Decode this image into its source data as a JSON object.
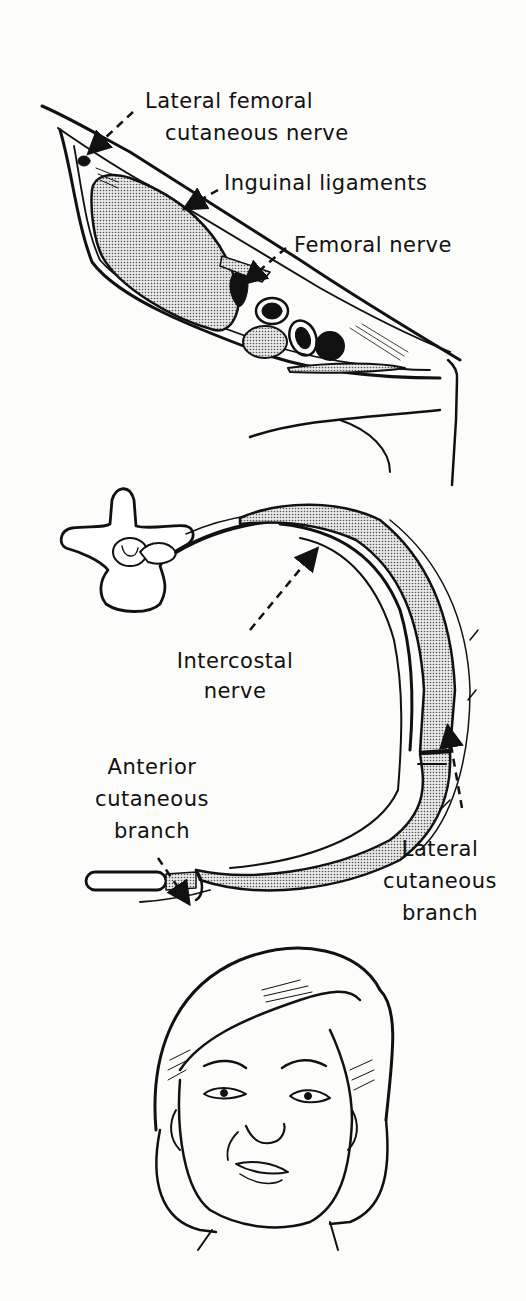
{
  "figure": {
    "panels": [
      {
        "id": "inguinal",
        "labels": {
          "lateral_femoral_line1": "Lateral femoral",
          "lateral_femoral_line2": "cutaneous nerve",
          "inguinal_ligaments": "Inguinal ligaments",
          "femoral_nerve": "Femoral nerve"
        }
      },
      {
        "id": "intercostal",
        "labels": {
          "intercostal_line1": "Intercostal",
          "intercostal_line2": "nerve",
          "anterior_line1": "Anterior",
          "anterior_line2": "cutaneous",
          "anterior_line3": "branch",
          "lateral_line1": "Lateral",
          "lateral_line2": "cutaneous",
          "lateral_line3": "branch"
        }
      },
      {
        "id": "face",
        "labels": {}
      }
    ],
    "colors": {
      "ink": "#111111",
      "stipple": "#bdbdbd",
      "paper": "#fcfcfa"
    }
  }
}
